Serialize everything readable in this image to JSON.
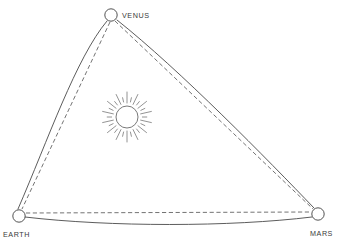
{
  "diagram": {
    "background_color": "#ffffff",
    "stroke_color": "#4a4a4a",
    "label_color": "#3a3a3a",
    "width": 342,
    "height": 249
  },
  "sun": {
    "name": "Sun",
    "icon": "sun-icon",
    "center_x": 127,
    "center_y": 117,
    "core_radius": 11,
    "ray_inner_radius": 14,
    "ray_outer_radius": 25,
    "ray_count": 28,
    "color": "#6a6a6a"
  },
  "planets": [
    {
      "id": "venus",
      "label": "VENUS",
      "x": 111,
      "y": 15,
      "radius": 6.2,
      "label_x": 122,
      "label_y": 18,
      "label_anchor": "start"
    },
    {
      "id": "earth",
      "label": "EARTH",
      "x": 19,
      "y": 216,
      "radius": 6.2,
      "label_x": 3,
      "label_y": 237,
      "label_anchor": "start"
    },
    {
      "id": "mars",
      "label": "MARS",
      "x": 318,
      "y": 214,
      "radius": 6.2,
      "label_x": 310,
      "label_y": 236,
      "label_anchor": "start"
    }
  ],
  "edges": [
    {
      "id": "venus-earth",
      "from": "venus",
      "to": "earth",
      "solid_path": "M 107 21 C 76 58 48 140 18 209",
      "dashed_path": "M 110 22 L 22 209",
      "solid_style": "curved",
      "dashed_style": "straight"
    },
    {
      "id": "venus-mars",
      "from": "venus",
      "to": "mars",
      "solid_path": "M 117 20 C 180 70 268 160 314 208",
      "dashed_path": "M 115 21 L 313 209",
      "solid_style": "curved",
      "dashed_style": "straight"
    },
    {
      "id": "earth-mars",
      "from": "earth",
      "to": "mars",
      "solid_path": "M 25 217 C 110 227 230 227 312 217",
      "dashed_path": "M 26 213 L 311 212",
      "solid_style": "curved",
      "dashed_style": "straight"
    }
  ]
}
